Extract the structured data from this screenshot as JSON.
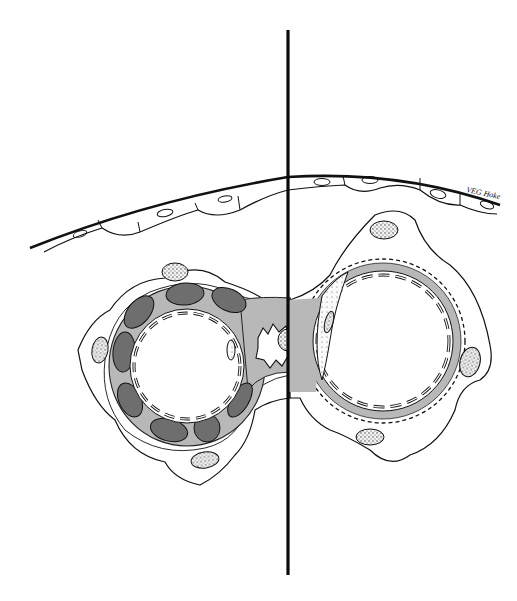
{
  "figure": {
    "type": "histological cross-section illustration",
    "signature": "VEG  Hoke",
    "colors": {
      "ink": "#111111",
      "background": "#ffffff",
      "light_gray": "#b8b8b8",
      "dark_gray": "#6e6e6e",
      "nucleus_fill": "#e8e8e8"
    },
    "divider": {
      "x": 288,
      "y_top": 30,
      "y_bottom": 575
    },
    "left_vessel": {
      "center": [
        187,
        366
      ],
      "lumen_radius": 57,
      "wall_outer_radius": 80,
      "dark_cell_count": 11
    },
    "right_vessel": {
      "center": [
        383,
        341
      ],
      "lumen_radius": 70,
      "wall_outer_radius": 82,
      "crenated": true
    }
  }
}
